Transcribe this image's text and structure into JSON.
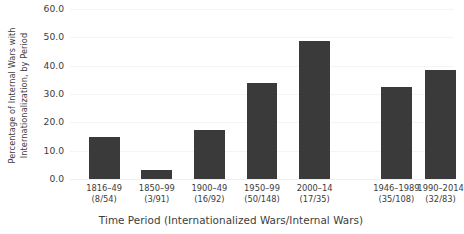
{
  "chart_data": {
    "type": "bar",
    "title": "",
    "xlabel": "Time Period (Internationalized Wars/Internal Wars)",
    "ylabel": "Percentage of Internal Wars with Internationalization, by Period",
    "ylabel_line1": "Percentage of Internal Wars with",
    "ylabel_line2": "Internationalization, by Period",
    "ylim": [
      0.0,
      60.0
    ],
    "yticks": [
      "0.0",
      "10.0",
      "20.0",
      "30.0",
      "40.0",
      "50.0",
      "60.0"
    ],
    "ytick_values": [
      0.0,
      10.0,
      20.0,
      30.0,
      40.0,
      50.0,
      60.0
    ],
    "grid": true,
    "legend": "none",
    "bar_color": "#3a3a3a",
    "categories": [
      "1816–49",
      "1850–99",
      "1900–49",
      "1950–99",
      "2000–14",
      "1946–1989",
      "1990–2014"
    ],
    "values": [
      14.8,
      3.3,
      17.4,
      33.8,
      48.6,
      32.4,
      38.6
    ],
    "bars": [
      {
        "period": "1816–49",
        "counts": "(8/54)",
        "internationalized": 8,
        "internal": 54,
        "value": 14.8,
        "center_pct": 8.9,
        "width_pct": 8.0,
        "group": 1
      },
      {
        "period": "1850–99",
        "counts": "(3/91)",
        "internationalized": 3,
        "internal": 91,
        "value": 3.3,
        "center_pct": 22.6,
        "width_pct": 8.0,
        "group": 1
      },
      {
        "period": "1900–49",
        "counts": "(16/92)",
        "internationalized": 16,
        "internal": 92,
        "value": 17.4,
        "center_pct": 36.3,
        "width_pct": 8.0,
        "group": 1
      },
      {
        "period": "1950–99",
        "counts": "(50/148)",
        "internationalized": 50,
        "internal": 148,
        "value": 33.8,
        "center_pct": 50.0,
        "width_pct": 8.0,
        "group": 1
      },
      {
        "period": "2000–14",
        "counts": "(17/35)",
        "internationalized": 17,
        "internal": 35,
        "value": 48.6,
        "center_pct": 63.7,
        "width_pct": 8.0,
        "group": 1
      },
      {
        "period": "1946–1989",
        "counts": "(35/108)",
        "internationalized": 35,
        "internal": 108,
        "value": 32.4,
        "center_pct": 85.0,
        "width_pct": 8.0,
        "group": 2
      },
      {
        "period": "1990–2014",
        "counts": "(32/83)",
        "internationalized": 32,
        "internal": 83,
        "value": 38.6,
        "center_pct": 96.5,
        "width_pct": 8.0,
        "group": 2
      }
    ]
  }
}
